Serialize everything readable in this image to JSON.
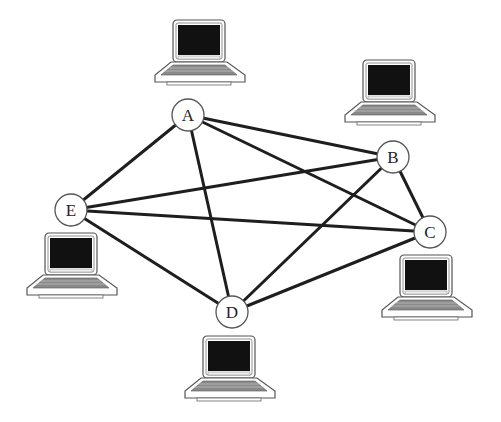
{
  "diagram": {
    "type": "network-graph",
    "colors": {
      "edge": "#1e1e1e",
      "node_fill": "#ffffff",
      "node_stroke": "#555555",
      "screen": "#111111",
      "laptop_body": "#ffffff",
      "keyboard": "#888888"
    },
    "nodes": [
      {
        "id": "A",
        "label": "A",
        "cx": 188,
        "cy": 115,
        "r": 16,
        "laptop": {
          "x": 155,
          "y": 20
        }
      },
      {
        "id": "B",
        "label": "B",
        "cx": 393,
        "cy": 157,
        "r": 16,
        "laptop": {
          "x": 345,
          "y": 60
        }
      },
      {
        "id": "C",
        "label": "C",
        "cx": 430,
        "cy": 232,
        "r": 16,
        "laptop": {
          "x": 382,
          "y": 255
        }
      },
      {
        "id": "D",
        "label": "D",
        "cx": 232,
        "cy": 312,
        "r": 16,
        "laptop": {
          "x": 185,
          "y": 336
        }
      },
      {
        "id": "E",
        "label": "E",
        "cx": 71,
        "cy": 210,
        "r": 16,
        "laptop": {
          "x": 27,
          "y": 233
        }
      }
    ],
    "edges": [
      [
        "A",
        "B"
      ],
      [
        "A",
        "C"
      ],
      [
        "A",
        "D"
      ],
      [
        "A",
        "E"
      ],
      [
        "B",
        "C"
      ],
      [
        "B",
        "D"
      ],
      [
        "B",
        "E"
      ],
      [
        "C",
        "D"
      ],
      [
        "C",
        "E"
      ],
      [
        "D",
        "E"
      ]
    ]
  }
}
